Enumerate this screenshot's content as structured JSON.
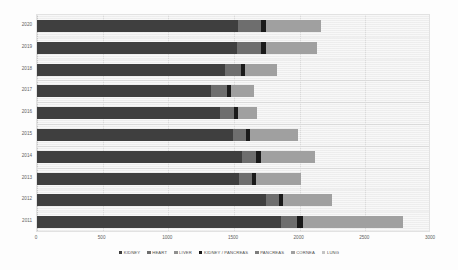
{
  "chart_data": {
    "type": "bar",
    "orientation": "horizontal",
    "stacked": true,
    "title": "",
    "xlabel": "",
    "ylabel": "",
    "xlim": [
      0,
      3000
    ],
    "ylim": null,
    "grid": true,
    "legend_position": "bottom",
    "xticks": [
      "0",
      "500",
      "1000",
      "1500",
      "2000",
      "2500",
      "3000"
    ],
    "xtick_values": [
      0,
      500,
      1000,
      1500,
      2000,
      2500,
      3000
    ],
    "categories": [
      "2020",
      "2019",
      "2018",
      "2017",
      "2016",
      "2015",
      "2014",
      "2013",
      "2012",
      "2011"
    ],
    "series": [
      {
        "name": "KIDNEY",
        "color": "#3f3f3f",
        "values": [
          1530,
          1525,
          1435,
          1325,
          1395,
          1490,
          1560,
          1540,
          1745,
          1860
        ]
      },
      {
        "name": "HEART",
        "color": "#6e6e6e",
        "values": [
          175,
          180,
          115,
          120,
          105,
          105,
          110,
          95,
          95,
          120
        ]
      },
      {
        "name": "LIVER",
        "color": "#8f8f8f",
        "values": [
          0,
          0,
          0,
          0,
          0,
          0,
          0,
          0,
          0,
          0
        ]
      },
      {
        "name": "KIDNEY / PANCREAS",
        "color": "#1a1a1a",
        "values": [
          35,
          40,
          35,
          35,
          30,
          30,
          35,
          35,
          35,
          45
        ]
      },
      {
        "name": "PANCREAS",
        "color": "#7d7d7d",
        "values": [
          0,
          0,
          0,
          0,
          0,
          0,
          0,
          0,
          0,
          0
        ]
      },
      {
        "name": "CORNEA",
        "color": "#a0a0a0",
        "values": [
          420,
          390,
          240,
          170,
          145,
          360,
          415,
          340,
          375,
          760
        ]
      },
      {
        "name": "LUNG",
        "color": "#c4c4c4",
        "values": [
          0,
          0,
          0,
          0,
          0,
          0,
          0,
          0,
          0,
          0
        ]
      }
    ],
    "totals": [
      2160,
      2135,
      1825,
      1650,
      1675,
      1985,
      2120,
      2010,
      2250,
      2785
    ]
  },
  "legend": {
    "items": [
      {
        "label": "KIDNEY",
        "color": "#3f3f3f"
      },
      {
        "label": "HEART",
        "color": "#6e6e6e"
      },
      {
        "label": "LIVER",
        "color": "#8f8f8f"
      },
      {
        "label": "KIDNEY / PANCREAS",
        "color": "#1a1a1a"
      },
      {
        "label": "PANCREAS",
        "color": "#7d7d7d"
      },
      {
        "label": "CORNEA",
        "color": "#a0a0a0"
      },
      {
        "label": "LUNG",
        "color": "#c4c4c4"
      }
    ]
  },
  "colors": {
    "plot_background": "#f0f0f0",
    "page_background": "#fdfdfd",
    "gridline": "#dddddd",
    "axis_text": "#606060"
  }
}
